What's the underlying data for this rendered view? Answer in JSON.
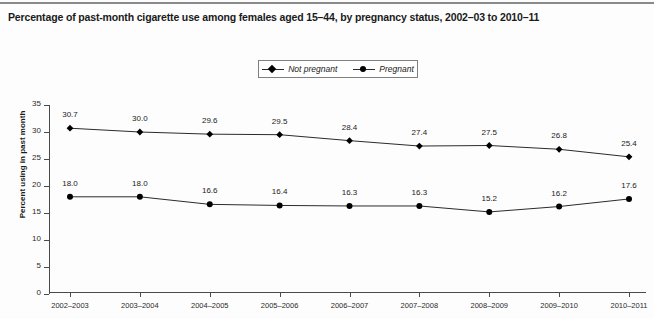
{
  "title": "Percentage of past-month cigarette use among females aged 15–44, by pregnancy status, 2002–03 to 2010–11",
  "legend": {
    "items": [
      {
        "label": "Not pregnant",
        "marker": "diamond"
      },
      {
        "label": "Pregnant",
        "marker": "circle"
      }
    ]
  },
  "axes": {
    "y_title": "Percent using in past month",
    "y_ticks": [
      "0",
      "5",
      "10",
      "15",
      "20",
      "25",
      "30",
      "35"
    ],
    "x_ticks": [
      "2002–2003",
      "2003–2004",
      "2004–2005",
      "2005–2006",
      "2006–2007",
      "2007–2008",
      "2008–2009",
      "2009–2010",
      "2010–2011"
    ]
  },
  "colors": {
    "line": "#2b2b2b",
    "marker": "#000000",
    "axis": "#4a4a4a",
    "text": "#1a1a1a",
    "background": "#fdfdfd"
  },
  "chart_data": {
    "type": "line",
    "title": "Percentage of past-month cigarette use among females aged 15–44, by pregnancy status, 2002–03 to 2010–11",
    "xlabel": "",
    "ylabel": "Percent using in past month",
    "ylim": [
      0,
      35
    ],
    "ytick_step": 5,
    "grid": false,
    "legend_position": "top-center",
    "categories": [
      "2002–2003",
      "2003–2004",
      "2004–2005",
      "2005–2006",
      "2006–2007",
      "2007–2008",
      "2008–2009",
      "2009–2010",
      "2010–2011"
    ],
    "series": [
      {
        "name": "Not pregnant",
        "marker": "diamond",
        "values": [
          30.7,
          30.0,
          29.6,
          29.5,
          28.4,
          27.4,
          27.5,
          26.8,
          25.4
        ],
        "labels": [
          "30.7",
          "30.0",
          "29.6",
          "29.5",
          "28.4",
          "27.4",
          "27.5",
          "26.8",
          "25.4"
        ]
      },
      {
        "name": "Pregnant",
        "marker": "circle",
        "values": [
          18.0,
          18.0,
          16.6,
          16.4,
          16.3,
          16.3,
          15.2,
          16.2,
          17.6
        ],
        "labels": [
          "18.0",
          "18.0",
          "16.6",
          "16.4",
          "16.3",
          "16.3",
          "15.2",
          "16.2",
          "17.6"
        ]
      }
    ]
  }
}
